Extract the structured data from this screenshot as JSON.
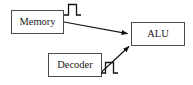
{
  "diagram": {
    "type": "block-diagram",
    "canvas": {
      "width": 193,
      "height": 85,
      "background": "#ffffff"
    },
    "style": {
      "box_stroke": "#4d4d4d",
      "box_fill": "#ffffff",
      "edge_color": "#111111",
      "pulse_color": "#111111",
      "text_color": "#1a1a1a"
    },
    "nodes": [
      {
        "id": "memory",
        "label": "Memory",
        "x": 11,
        "y": 10,
        "width": 53,
        "height": 24,
        "font_size": 10.5
      },
      {
        "id": "decoder",
        "label": "Decoder",
        "x": 48,
        "y": 53,
        "width": 54,
        "height": 24,
        "font_size": 10.5
      },
      {
        "id": "alu",
        "label": "ALU",
        "x": 131,
        "y": 22,
        "width": 54,
        "height": 24,
        "font_size": 10.5
      }
    ],
    "edges": [
      {
        "id": "memory-to-alu",
        "from": "memory",
        "to": "alu",
        "label": "",
        "arrowhead": "filled-triangle",
        "x1": 64,
        "y1": 22,
        "x2": 130,
        "y2": 34
      },
      {
        "id": "decoder-to-alu",
        "from": "decoder",
        "to": "alu",
        "label": "",
        "arrowhead": "filled-triangle",
        "x1": 102,
        "y1": 72,
        "x2": 131,
        "y2": 45
      }
    ],
    "signals": [
      {
        "id": "memory-signal-pulse",
        "label": "",
        "kind": "square-pulse",
        "on_edge": "memory-to-alu",
        "x": 64,
        "y": 4,
        "width": 17,
        "height": 11
      },
      {
        "id": "decoder-signal-pulse",
        "label": "",
        "kind": "square-pulse",
        "on_edge": "decoder-to-alu",
        "x": 101,
        "y": 62,
        "width": 17,
        "height": 11
      }
    ]
  }
}
